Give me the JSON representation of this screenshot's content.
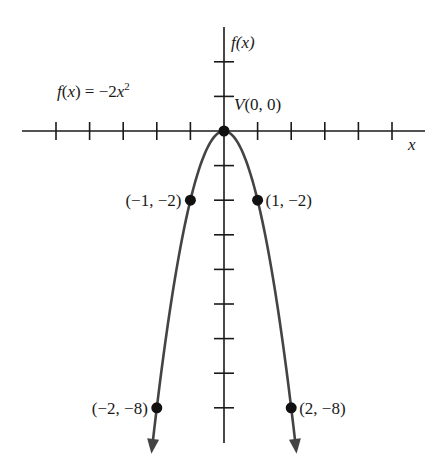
{
  "chart_data": {
    "type": "line",
    "title": "",
    "function_label": "f(x) = −2x²",
    "function_label_parts": {
      "lhs": "f(x) = −2x",
      "exp": "2"
    },
    "xlabel": "x",
    "ylabel": "f(x)",
    "xlim": [
      -6,
      6
    ],
    "ylim": [
      -9,
      3
    ],
    "x_ticks": [
      -5,
      -4,
      -3,
      -2,
      -1,
      1,
      2,
      3,
      4,
      5
    ],
    "y_ticks": [
      2,
      1,
      -1,
      -2,
      -3,
      -4,
      -5,
      -6,
      -7,
      -8
    ],
    "grid": false,
    "series": [
      {
        "name": "f(x) = -2x^2",
        "expression": "-2*x^2",
        "x_range": [
          -2.14,
          2.14
        ],
        "arrows_both_ends": true,
        "color": "#444444"
      }
    ],
    "points": [
      {
        "x": 0,
        "y": 0,
        "label": "V(0, 0)",
        "pos": "upper-right"
      },
      {
        "x": -1,
        "y": -2,
        "label": "(−1, −2)",
        "pos": "left"
      },
      {
        "x": 1,
        "y": -2,
        "label": "(1, −2)",
        "pos": "right"
      },
      {
        "x": -2,
        "y": -8,
        "label": "(−2, −8)",
        "pos": "left"
      },
      {
        "x": 2,
        "y": -8,
        "label": "(2, −8)",
        "pos": "right"
      }
    ]
  },
  "layout": {
    "origin_px": [
      224,
      131
    ],
    "x_unit_px": 33.6,
    "y_unit_px": 34.6,
    "x_axis_px": [
      22,
      425
    ],
    "y_axis_px": [
      27,
      443
    ],
    "axis_color": "#1a1a1a",
    "curve_color": "#444444"
  }
}
